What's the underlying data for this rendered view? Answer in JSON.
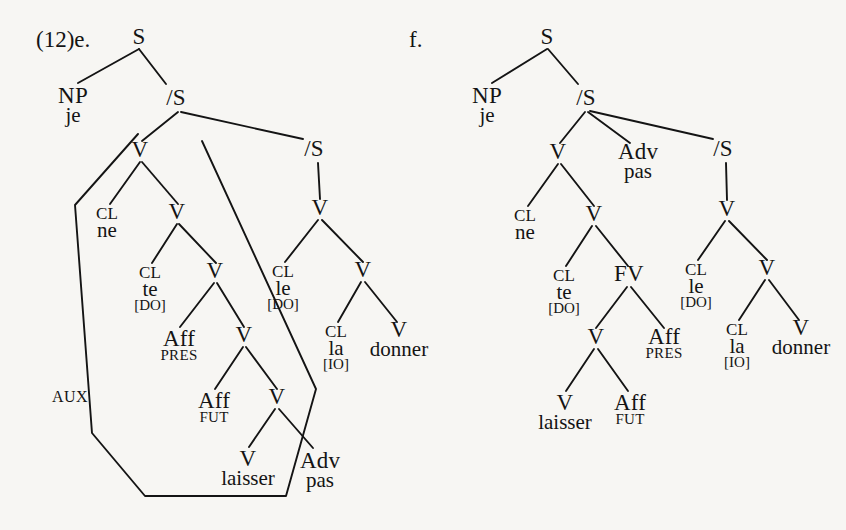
{
  "figure": {
    "example_number": "(12)",
    "panel_e_label": "e.",
    "panel_f_label": "f.",
    "background_color": "#f7f6f3",
    "ink_color": "#141414"
  },
  "tree_e": {
    "nodes": {
      "s_root": "S",
      "np": "NP",
      "np_word": "je",
      "sbar1": "/S",
      "v1": "V",
      "cl_ne": "CL",
      "cl_ne_word": "ne",
      "v2": "V",
      "cl_te": "CL",
      "cl_te_word": "te",
      "cl_te_feat": "[DO]",
      "v3": "V",
      "aff_pres": "Aff",
      "aff_pres_tense": "PRES",
      "v4": "V",
      "aff_fut": "Aff",
      "aff_fut_tense": "FUT",
      "v5": "V",
      "v_laisser": "V",
      "v_laisser_word": "laisser",
      "adv": "Adv",
      "adv_word": "pas",
      "sbar2": "/S",
      "v6": "V",
      "cl_le": "CL",
      "cl_le_word": "le",
      "cl_le_feat": "[DO]",
      "v7": "V",
      "cl_la": "CL",
      "cl_la_word": "la",
      "cl_la_feat": "[IO]",
      "v_donner": "V",
      "v_donner_word": "donner"
    },
    "aux_label": "AUX"
  },
  "tree_f": {
    "nodes": {
      "s_root": "S",
      "np": "NP",
      "np_word": "je",
      "sbar1": "/S",
      "v1": "V",
      "cl_ne": "CL",
      "cl_ne_word": "ne",
      "v2": "V",
      "cl_te": "CL",
      "cl_te_word": "te",
      "cl_te_feat": "[DO]",
      "fv": "FV",
      "v3": "V",
      "v_laisser": "V",
      "v_laisser_word": "laisser",
      "aff_fut": "Aff",
      "aff_fut_tense": "FUT",
      "aff_pres": "Aff",
      "aff_pres_tense": "PRES",
      "adv": "Adv",
      "adv_word": "pas",
      "sbar2": "/S",
      "v4": "V",
      "cl_le": "CL",
      "cl_le_word": "le",
      "cl_le_feat": "[DO]",
      "v5": "V",
      "cl_la": "CL",
      "cl_la_word": "la",
      "cl_la_feat": "[IO]",
      "v_donner": "V",
      "v_donner_word": "donner"
    }
  }
}
